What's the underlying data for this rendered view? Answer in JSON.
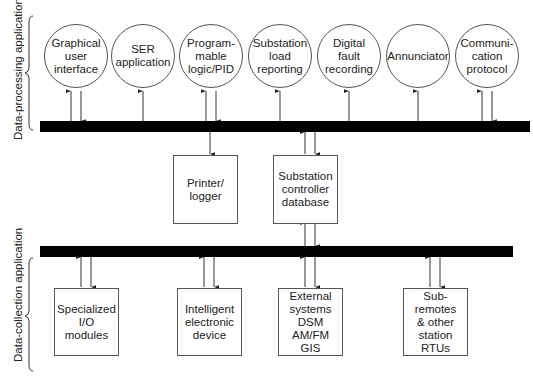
{
  "sections": {
    "processing_label": "Data-processing application",
    "collection_label": "Data-collection application"
  },
  "applications": [
    {
      "label": "Graphical\nuser\ninterface"
    },
    {
      "label": "SER\napplication"
    },
    {
      "label": "Program-\nmable\nlogic/PID"
    },
    {
      "label": "Substation\nload\nreporting"
    },
    {
      "label": "Digital\nfault\nrecording"
    },
    {
      "label": "Annunciator"
    },
    {
      "label": "Communi-\ncation\nprotocol"
    }
  ],
  "middle_boxes": [
    {
      "label": "Printer/\nlogger"
    },
    {
      "label": "Substation\ncontroller\ndatabase"
    }
  ],
  "devices": [
    {
      "label": "Specialized\nI/O\nmodules"
    },
    {
      "label": "Intelligent\nelectronic\ndevice"
    },
    {
      "label": "External\nsystems\nDSM\nAM/FM\nGIS"
    },
    {
      "label": "Sub-remotes\n& other\nstation\nRTUs"
    }
  ]
}
